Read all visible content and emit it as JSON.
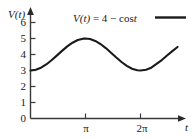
{
  "chart_data": {
    "type": "line",
    "title": "",
    "annotation": "V(t) = 4 − cos t",
    "xlabel": "t",
    "ylabel": "V(t)",
    "xlim": [
      0,
      9.2
    ],
    "ylim": [
      0,
      6.6
    ],
    "grid": false,
    "legend_position": "top-right",
    "x_ticks": [
      {
        "value": 3.14159,
        "label": "π"
      },
      {
        "value": 6.28319,
        "label": "2π"
      }
    ],
    "y_ticks": [
      {
        "value": 0,
        "label": "0"
      },
      {
        "value": 1,
        "label": "1"
      },
      {
        "value": 2,
        "label": "2"
      },
      {
        "value": 3,
        "label": "3"
      },
      {
        "value": 4,
        "label": "4"
      },
      {
        "value": 5,
        "label": "5"
      },
      {
        "value": 6,
        "label": "6"
      }
    ],
    "series": [
      {
        "name": "V(t) = 4 − cos t",
        "color": "#1a1a1a",
        "x": [
          0,
          0.3,
          0.6,
          0.9,
          1.2,
          1.5,
          1.8,
          2.1,
          2.4,
          2.7,
          3.0,
          3.14159,
          3.4,
          3.7,
          4.0,
          4.3,
          4.6,
          4.9,
          5.2,
          5.5,
          5.8,
          6.1,
          6.28319,
          6.6,
          6.9,
          7.2,
          7.5,
          7.8,
          8.1,
          8.4
        ],
        "y": [
          3.0,
          3.045,
          3.175,
          3.378,
          3.638,
          3.929,
          4.227,
          4.505,
          4.737,
          4.904,
          4.99,
          5.0,
          4.967,
          4.848,
          4.654,
          4.401,
          4.112,
          3.814,
          3.532,
          3.291,
          3.112,
          3.012,
          3.0,
          3.05,
          3.175,
          3.411,
          3.654,
          3.934,
          4.21,
          4.47
        ]
      }
    ]
  },
  "axes": {
    "y_axis_label": "V(t)",
    "x_axis_label": "t",
    "y_arrow": "up-arrow",
    "x_arrow": "right-arrow"
  },
  "legend": {
    "equation_text": "V(t) = 4 − cos t",
    "equation_parts": {
      "v": "V",
      "open_paren": "(",
      "t": "t",
      "close_paren": ")",
      "equals": "=",
      "four": "4",
      "minus": "−",
      "cos": "cos",
      "var": "t"
    },
    "sample_line_color": "#1a1a1a"
  },
  "colors": {
    "background": "#ffffff",
    "axis": "#3a3a3a",
    "curve": "#1a1a1a",
    "text": "#1a1a1a"
  }
}
